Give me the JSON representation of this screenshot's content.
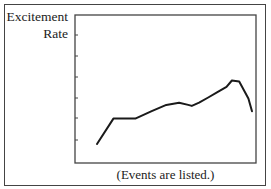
{
  "chart_data": {
    "type": "line",
    "title": "",
    "ylabel": "Excitement Rate",
    "ylabel_lines": [
      "Excitement",
      "Rate"
    ],
    "xlabel": "(Events are listed.)",
    "grid": false,
    "legend": null,
    "y_ticks_count": 6,
    "y_tick_labels": [],
    "x_tick_labels": [],
    "ylim": [
      0,
      7
    ],
    "series": [
      {
        "name": "Excitement Rate",
        "x": [
          0,
          0.9,
          2.1,
          3.0,
          3.8,
          4.5,
          5.0,
          5.2,
          5.6,
          6.1,
          6.6,
          7.1,
          7.4,
          7.8,
          8.3,
          8.5
        ],
        "values": [
          0.9,
          2.1,
          2.1,
          2.45,
          2.75,
          2.85,
          2.75,
          2.7,
          2.85,
          3.1,
          3.35,
          3.6,
          3.9,
          3.85,
          3.05,
          2.45
        ]
      }
    ]
  },
  "labels": {
    "y_line1": "Excitement",
    "y_line2": "Rate",
    "x": "(Events are listed.)"
  },
  "colors": {
    "line": "#1a1a1a",
    "frame": "#444444",
    "background": "#ffffff"
  }
}
